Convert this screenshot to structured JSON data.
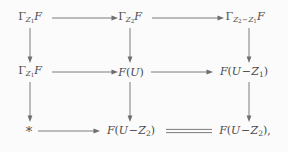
{
  "diagram": {
    "kind": "commutative-diagram",
    "rows": 3,
    "columns": 3,
    "background_color": "#fbfbfb",
    "ink_color": "#6e6e6e",
    "text_color": "#4a4a4a",
    "nodes": {
      "r1c1": "Γ_{Z₁}F",
      "r1c2": "Γ_{Z₂}F",
      "r1c3": "Γ_{Z₂−Z₁}F",
      "r2c1": "Γ_{Z₁}F",
      "r2c2": "F(U)",
      "r2c3": "F(U − Z₁)",
      "r3c1": "*",
      "r3c2": "F(U − Z₂)",
      "r3c3": "F(U − Z₂),"
    },
    "edges": [
      {
        "from": "r1c1",
        "to": "r1c2",
        "type": "arrow",
        "direction": "right"
      },
      {
        "from": "r1c2",
        "to": "r1c3",
        "type": "arrow",
        "direction": "right"
      },
      {
        "from": "r2c1",
        "to": "r2c2",
        "type": "arrow",
        "direction": "right"
      },
      {
        "from": "r2c2",
        "to": "r2c3",
        "type": "arrow",
        "direction": "right"
      },
      {
        "from": "r3c1",
        "to": "r3c2",
        "type": "arrow",
        "direction": "right"
      },
      {
        "from": "r3c2",
        "to": "r3c3",
        "type": "equality",
        "direction": "none"
      },
      {
        "from": "r1c1",
        "to": "r2c1",
        "type": "arrow",
        "direction": "down"
      },
      {
        "from": "r1c2",
        "to": "r2c2",
        "type": "arrow",
        "direction": "down"
      },
      {
        "from": "r1c3",
        "to": "r2c3",
        "type": "arrow",
        "direction": "down"
      },
      {
        "from": "r2c1",
        "to": "r3c1",
        "type": "arrow",
        "direction": "down"
      },
      {
        "from": "r2c2",
        "to": "r3c2",
        "type": "arrow",
        "direction": "down"
      },
      {
        "from": "r2c3",
        "to": "r3c3",
        "type": "arrow",
        "direction": "down"
      }
    ],
    "symbols": {
      "Gamma": "Γ",
      "minus": "−",
      "star": "*",
      "period": ",",
      "F": "F",
      "U": "U",
      "Z": "Z",
      "sub1": "1",
      "sub2": "2"
    }
  }
}
